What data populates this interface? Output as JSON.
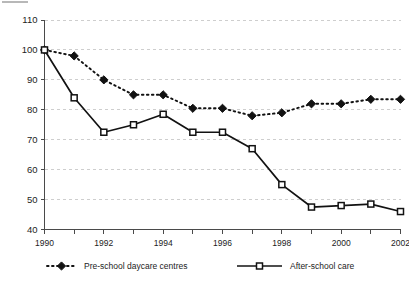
{
  "chart_data": {
    "type": "line",
    "title": "",
    "subtitle": "",
    "xlabel": "",
    "ylabel": "",
    "categories": [
      1990,
      1991,
      1992,
      1993,
      1994,
      1995,
      1996,
      1997,
      1998,
      1999,
      2000,
      2001,
      2002
    ],
    "x_tick_labels": [
      "1990",
      "",
      "1992",
      "",
      "1994",
      "",
      "1996",
      "",
      "1998",
      "",
      "2000",
      "",
      "2002"
    ],
    "xlim": [
      1990,
      2002
    ],
    "ylim": [
      40,
      110
    ],
    "y_ticks": [
      40,
      50,
      60,
      70,
      80,
      90,
      100,
      110
    ],
    "y_tick_labels": [
      "40",
      "50",
      "60",
      "70",
      "80",
      "90",
      "100",
      "110"
    ],
    "grid": "horizontal-dashed",
    "legend_position": "bottom",
    "series": [
      {
        "name": "Pre-school daycare centres",
        "style": "dotted",
        "marker": "filled-diamond",
        "color": "#121212",
        "values": [
          100,
          98,
          90,
          85,
          85,
          80.5,
          80.5,
          78,
          79,
          82,
          82,
          83.5,
          83.5
        ]
      },
      {
        "name": "After-school care",
        "style": "solid",
        "marker": "open-square",
        "color": "#121212",
        "values": [
          100,
          84,
          72.5,
          75,
          78.5,
          72.5,
          72.5,
          67,
          55,
          47.5,
          48,
          48.5,
          46
        ]
      }
    ]
  },
  "legend": {
    "items": [
      {
        "label": "Pre-school daycare centres",
        "marker": "filled-diamond",
        "line": "dotted"
      },
      {
        "label": "After-school care",
        "marker": "open-square",
        "line": "solid"
      }
    ]
  }
}
